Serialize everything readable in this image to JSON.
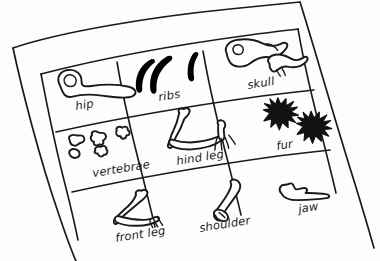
{
  "scene": {
    "title": "Hand-drawn bone identification chart",
    "medium": "pen sketch on tilted paper",
    "background_color": "#ffffff",
    "ink_color": "#1a1a1a",
    "paper_rotation_note": "paper tilted counter-clockwise, rows slope downward to the left"
  },
  "table": {
    "rows": 3,
    "columns": 3,
    "cells": [
      {
        "id": "cell-hip",
        "row": 1,
        "column": 1,
        "label": "hip",
        "sketch": "hip-bone-icon"
      },
      {
        "id": "cell-ribs",
        "row": 1,
        "column": 2,
        "label": "ribs",
        "sketch": "ribs-icon"
      },
      {
        "id": "cell-skull",
        "row": 1,
        "column": 3,
        "label": "skull",
        "sketch": "skull-icon"
      },
      {
        "id": "cell-vertebrae",
        "row": 2,
        "column": 1,
        "label": "vertebrae",
        "sketch": "vertebrae-icon"
      },
      {
        "id": "cell-hind-leg",
        "row": 2,
        "column": 2,
        "label": "hind leg",
        "sketch": "hind-leg-icon"
      },
      {
        "id": "cell-fur",
        "row": 2,
        "column": 3,
        "label": "fur",
        "sketch": "fur-icon"
      },
      {
        "id": "cell-front-leg",
        "row": 3,
        "column": 1,
        "label": "front leg",
        "sketch": "front-leg-icon"
      },
      {
        "id": "cell-shoulder",
        "row": 3,
        "column": 2,
        "label": "shoulder",
        "sketch": "shoulder-icon"
      },
      {
        "id": "cell-jaw",
        "row": 3,
        "column": 3,
        "label": "jaw",
        "sketch": "jaw-icon"
      }
    ]
  }
}
